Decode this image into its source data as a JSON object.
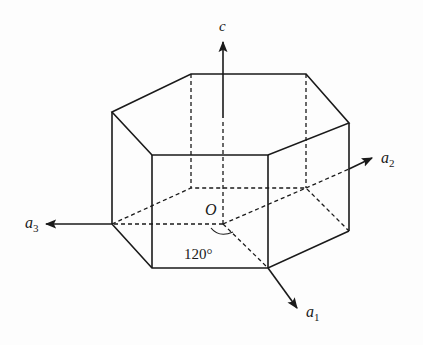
{
  "diagram": {
    "type": "hexagonal-prism-crystal-axes",
    "axes": {
      "c": {
        "label": "c"
      },
      "a1": {
        "label": "a",
        "subscript": "1"
      },
      "a2": {
        "label": "a",
        "subscript": "2"
      },
      "a3": {
        "label": "a",
        "subscript": "3"
      }
    },
    "origin_label": "O",
    "angle_label": "120°",
    "colors": {
      "line": "#1a1a1a",
      "background": "#fdfdfd"
    }
  }
}
